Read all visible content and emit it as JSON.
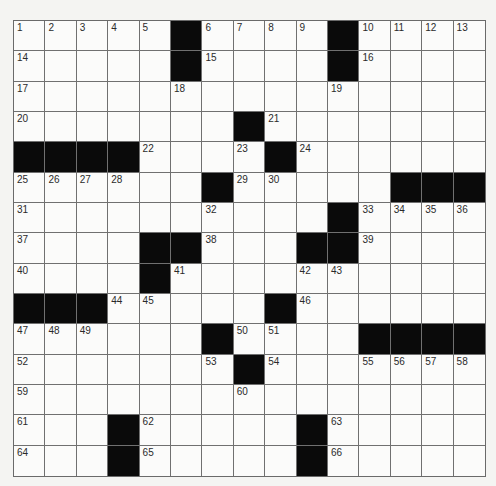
{
  "puzzle": {
    "rows": 15,
    "cols": 15,
    "colors": {
      "background": "#f4f4f2",
      "cell": "#fbfbfa",
      "block": "#0a0a0a",
      "line": "#707070",
      "number": "#2a2a2a"
    },
    "layout": [
      ".....#....#...",
      ".....#....#...",
      "...............",
      ".......#.......",
      "####....#......",
      "......#.....###",
      "..........#....",
      "....##...##....",
      "....#..........",
      "###.....#......",
      "......#....####",
      ".......#.......",
      "...............",
      "...#.....#.....",
      "...#.....#....."
    ],
    "grid": [
      [
        ".",
        ".",
        ".",
        ".",
        ".",
        "#",
        ".",
        ".",
        ".",
        ".",
        "#",
        ".",
        ".",
        ".",
        "."
      ],
      [
        ".",
        ".",
        ".",
        ".",
        ".",
        "#",
        ".",
        ".",
        ".",
        ".",
        "#",
        ".",
        ".",
        ".",
        "."
      ],
      [
        ".",
        ".",
        ".",
        ".",
        ".",
        ".",
        ".",
        ".",
        ".",
        ".",
        ".",
        ".",
        ".",
        ".",
        "."
      ],
      [
        ".",
        ".",
        ".",
        ".",
        ".",
        ".",
        ".",
        "#",
        ".",
        ".",
        ".",
        ".",
        ".",
        ".",
        "."
      ],
      [
        "#",
        "#",
        "#",
        "#",
        ".",
        ".",
        ".",
        ".",
        "#",
        ".",
        ".",
        ".",
        ".",
        ".",
        "."
      ],
      [
        ".",
        ".",
        ".",
        ".",
        ".",
        ".",
        "#",
        ".",
        ".",
        ".",
        ".",
        ".",
        "#",
        "#",
        "#"
      ],
      [
        ".",
        ".",
        ".",
        ".",
        ".",
        ".",
        ".",
        ".",
        ".",
        ".",
        "#",
        ".",
        ".",
        ".",
        "."
      ],
      [
        ".",
        ".",
        ".",
        ".",
        "#",
        "#",
        ".",
        ".",
        ".",
        "#",
        "#",
        ".",
        ".",
        ".",
        "."
      ],
      [
        ".",
        ".",
        ".",
        ".",
        "#",
        ".",
        ".",
        ".",
        ".",
        ".",
        ".",
        ".",
        ".",
        ".",
        "."
      ],
      [
        "#",
        "#",
        "#",
        ".",
        ".",
        ".",
        ".",
        ".",
        "#",
        ".",
        ".",
        ".",
        ".",
        ".",
        "."
      ],
      [
        ".",
        ".",
        ".",
        ".",
        ".",
        ".",
        "#",
        ".",
        ".",
        ".",
        ".",
        "#",
        "#",
        "#",
        "#"
      ],
      [
        ".",
        ".",
        ".",
        ".",
        ".",
        ".",
        ".",
        "#",
        ".",
        ".",
        ".",
        ".",
        ".",
        ".",
        "."
      ],
      [
        ".",
        ".",
        ".",
        ".",
        ".",
        ".",
        ".",
        ".",
        ".",
        ".",
        ".",
        ".",
        ".",
        ".",
        "."
      ],
      [
        ".",
        ".",
        ".",
        "#",
        ".",
        ".",
        ".",
        ".",
        ".",
        "#",
        ".",
        ".",
        ".",
        ".",
        "."
      ],
      [
        ".",
        ".",
        ".",
        "#",
        ".",
        ".",
        ".",
        ".",
        ".",
        "#",
        ".",
        ".",
        ".",
        ".",
        "."
      ]
    ],
    "numbers": [
      [
        "1",
        "2",
        "3",
        "4",
        "5",
        "",
        "6",
        "7",
        "8",
        "9",
        "",
        "11",
        "12",
        "13",
        ""
      ],
      [
        "14",
        "",
        "",
        "",
        "",
        "",
        "15",
        "",
        "",
        "",
        "",
        "16",
        "",
        "",
        ""
      ],
      [
        "17",
        "",
        "",
        "",
        "",
        "18",
        "",
        "",
        "",
        "",
        "19",
        "",
        "",
        "",
        ""
      ],
      [
        "20",
        "",
        "",
        "",
        "",
        "",
        "",
        "",
        "21",
        "",
        "",
        "",
        "",
        "",
        ""
      ],
      [
        "",
        "",
        "",
        "",
        "22",
        "",
        "",
        "23",
        "",
        "24",
        "",
        "",
        "",
        "",
        ""
      ],
      [
        "25",
        "26",
        "27",
        "28",
        "",
        "",
        "",
        "29",
        "30",
        "",
        "",
        "",
        "",
        "",
        ""
      ],
      [
        "31",
        "",
        "",
        "",
        "",
        "",
        "32",
        "",
        "",
        "",
        "",
        "33",
        "34",
        "35",
        "36"
      ],
      [
        "37",
        "",
        "",
        "",
        "",
        "",
        "38",
        "",
        "",
        "",
        "",
        "39",
        "",
        "",
        ""
      ],
      [
        "40",
        "",
        "",
        "",
        "",
        "41",
        "",
        "",
        "",
        "42",
        "43",
        "",
        "",
        "",
        ""
      ],
      [
        "",
        "",
        "",
        "44",
        "45",
        "",
        "",
        "",
        "",
        "46",
        "",
        "",
        "",
        "",
        ""
      ],
      [
        "47",
        "48",
        "49",
        "",
        "",
        "",
        "",
        "50",
        "51",
        "",
        "",
        "",
        "",
        "",
        ""
      ],
      [
        "52",
        "",
        "",
        "",
        "",
        "",
        "53",
        "",
        "54",
        "",
        "",
        "55",
        "56",
        "57",
        "58"
      ],
      [
        "59",
        "",
        "",
        "",
        "",
        "",
        "",
        "60",
        "",
        "",
        "",
        "",
        "",
        "",
        ""
      ],
      [
        "61",
        "",
        "",
        "",
        "62",
        "",
        "",
        "",
        "",
        "",
        "63",
        "",
        "",
        "",
        ""
      ],
      [
        "64",
        "",
        "",
        "",
        "65",
        "",
        "",
        "",
        "",
        "",
        "66",
        "",
        "",
        "",
        ""
      ]
    ]
  }
}
